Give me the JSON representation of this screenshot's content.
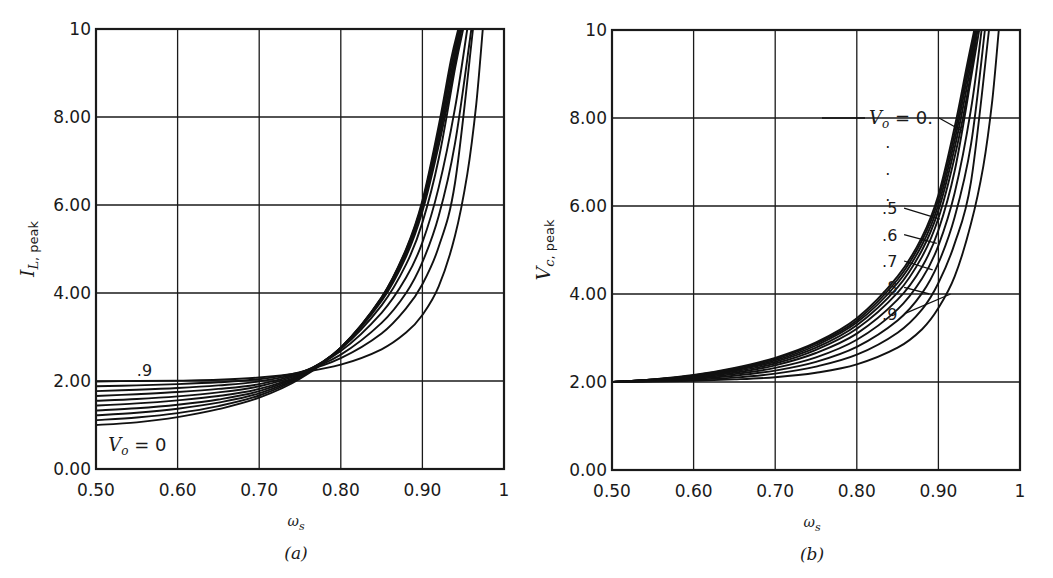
{
  "chart_data": [
    {
      "id": "a",
      "type": "line",
      "title": "",
      "caption": "(a)",
      "xlabel": "ω_s",
      "ylabel": "I_L, peak",
      "ylabel_main": "I",
      "ylabel_sub": "L, peak",
      "xlabel_main": "ω",
      "xlabel_sub": "s",
      "xlim": [
        0.5,
        1.0
      ],
      "ylim": [
        0,
        10
      ],
      "grid": true,
      "xticks": [
        "0.50",
        "0.60",
        "0.70",
        "0.80",
        "0.90",
        "1"
      ],
      "yticks": [
        "0.00",
        "2.00",
        "4.00",
        "6.00",
        "8.00",
        "10"
      ],
      "annotations": [
        {
          "text": ".9",
          "x": 0.55,
          "y": 2.25
        },
        {
          "text": "V_o = 0",
          "x": 0.515,
          "y": 0.55
        }
      ],
      "series": [
        {
          "name": "V_o = 0",
          "x": [
            0.5,
            0.55,
            0.6,
            0.65,
            0.7,
            0.75,
            0.8,
            0.85,
            0.88,
            0.9,
            0.92,
            0.935,
            0.944
          ],
          "values": [
            1.0,
            1.06,
            1.18,
            1.36,
            1.62,
            2.05,
            2.75,
            3.9,
            5.0,
            6.1,
            7.8,
            9.3,
            10.0
          ]
        },
        {
          "name": "V_o = 0.1",
          "x": [
            0.5,
            0.55,
            0.6,
            0.65,
            0.7,
            0.75,
            0.8,
            0.85,
            0.88,
            0.9,
            0.92,
            0.935,
            0.945
          ],
          "values": [
            1.11,
            1.17,
            1.27,
            1.43,
            1.67,
            2.08,
            2.76,
            3.9,
            4.98,
            6.05,
            7.7,
            9.15,
            10.0
          ]
        },
        {
          "name": "V_o = 0.2",
          "x": [
            0.5,
            0.55,
            0.6,
            0.65,
            0.7,
            0.75,
            0.8,
            0.85,
            0.88,
            0.9,
            0.92,
            0.935,
            0.946
          ],
          "values": [
            1.22,
            1.28,
            1.37,
            1.51,
            1.72,
            2.1,
            2.76,
            3.88,
            4.95,
            6.0,
            7.6,
            9.0,
            10.0
          ]
        },
        {
          "name": "V_o = 0.3",
          "x": [
            0.5,
            0.55,
            0.6,
            0.65,
            0.7,
            0.75,
            0.8,
            0.85,
            0.88,
            0.9,
            0.92,
            0.935,
            0.947
          ],
          "values": [
            1.33,
            1.38,
            1.46,
            1.58,
            1.77,
            2.12,
            2.76,
            3.86,
            4.9,
            5.93,
            7.48,
            8.85,
            10.0
          ]
        },
        {
          "name": "V_o = 0.4",
          "x": [
            0.5,
            0.55,
            0.6,
            0.65,
            0.7,
            0.75,
            0.8,
            0.85,
            0.88,
            0.9,
            0.92,
            0.935,
            0.948
          ],
          "values": [
            1.44,
            1.49,
            1.56,
            1.66,
            1.82,
            2.14,
            2.75,
            3.82,
            4.83,
            5.85,
            7.35,
            8.7,
            10.0
          ]
        },
        {
          "name": "V_o = 0.5",
          "x": [
            0.5,
            0.55,
            0.6,
            0.65,
            0.7,
            0.75,
            0.8,
            0.85,
            0.88,
            0.9,
            0.92,
            0.94,
            0.95
          ],
          "values": [
            1.55,
            1.59,
            1.65,
            1.74,
            1.88,
            2.16,
            2.73,
            3.72,
            4.65,
            5.6,
            7.05,
            9.1,
            10.0
          ]
        },
        {
          "name": "V_o = 0.6",
          "x": [
            0.5,
            0.55,
            0.6,
            0.65,
            0.7,
            0.75,
            0.8,
            0.85,
            0.88,
            0.9,
            0.92,
            0.94,
            0.955
          ],
          "values": [
            1.66,
            1.7,
            1.75,
            1.82,
            1.93,
            2.18,
            2.68,
            3.55,
            4.35,
            5.15,
            6.4,
            8.2,
            10.0
          ]
        },
        {
          "name": "V_o = 0.7",
          "x": [
            0.5,
            0.55,
            0.6,
            0.65,
            0.7,
            0.75,
            0.8,
            0.85,
            0.88,
            0.9,
            0.92,
            0.94,
            0.96
          ],
          "values": [
            1.77,
            1.8,
            1.84,
            1.9,
            1.99,
            2.19,
            2.6,
            3.32,
            4.0,
            4.7,
            5.75,
            7.4,
            10.0
          ]
        },
        {
          "name": "V_o = 0.8",
          "x": [
            0.5,
            0.55,
            0.6,
            0.65,
            0.7,
            0.75,
            0.8,
            0.85,
            0.88,
            0.9,
            0.92,
            0.94,
            0.962
          ],
          "values": [
            1.88,
            1.9,
            1.93,
            1.97,
            2.04,
            2.2,
            2.52,
            3.08,
            3.65,
            4.2,
            5.05,
            6.5,
            10.0
          ]
        },
        {
          "name": "V_o = 0.9",
          "x": [
            0.5,
            0.55,
            0.6,
            0.65,
            0.7,
            0.75,
            0.8,
            0.85,
            0.88,
            0.9,
            0.92,
            0.94,
            0.955,
            0.966,
            0.974
          ],
          "values": [
            1.99,
            2.0,
            2.01,
            2.03,
            2.08,
            2.19,
            2.37,
            2.72,
            3.1,
            3.5,
            4.15,
            5.3,
            6.7,
            8.3,
            10.0
          ]
        }
      ]
    },
    {
      "id": "b",
      "type": "line",
      "title": "",
      "caption": "(b)",
      "xlabel": "ω_s",
      "ylabel": "V_c, peak",
      "ylabel_main": "V",
      "ylabel_sub": "c, peak",
      "xlabel_main": "ω",
      "xlabel_sub": "s",
      "xlim": [
        0.5,
        1.0
      ],
      "ylim": [
        0,
        10
      ],
      "grid": true,
      "xticks": [
        "0.50",
        "0.60",
        "0.70",
        "0.80",
        "0.90",
        "1"
      ],
      "yticks": [
        "0.00",
        "2.00",
        "4.00",
        "6.00",
        "8.00",
        "10"
      ],
      "annotations": [
        {
          "text": "V_o = 0.",
          "x": 0.815,
          "y": 8.0,
          "target_x": 0.93,
          "target_y": 7.7
        },
        {
          "text": ".",
          "x": 0.835,
          "y": 7.45
        },
        {
          "text": ".",
          "x": 0.835,
          "y": 6.85
        },
        {
          "text": ".",
          "x": 0.835,
          "y": 6.25
        },
        {
          "text": ".5",
          "x": 0.831,
          "y": 5.95,
          "target_x": 0.902,
          "target_y": 5.7
        },
        {
          "text": ".6",
          "x": 0.831,
          "y": 5.35,
          "target_x": 0.898,
          "target_y": 5.15
        },
        {
          "text": ".7",
          "x": 0.831,
          "y": 4.75,
          "target_x": 0.893,
          "target_y": 4.55
        },
        {
          "text": ".8",
          "x": 0.831,
          "y": 4.15,
          "target_x": 0.889,
          "target_y": 4.0
        },
        {
          "text": ".9",
          "x": 0.831,
          "y": 3.55,
          "target_x": 0.915,
          "target_y": 4.0
        }
      ],
      "series": [
        {
          "name": "V_o = 0",
          "x": [
            0.5,
            0.55,
            0.6,
            0.65,
            0.7,
            0.75,
            0.8,
            0.85,
            0.88,
            0.9,
            0.92,
            0.935,
            0.944
          ],
          "values": [
            2.0,
            2.06,
            2.16,
            2.32,
            2.55,
            2.9,
            3.45,
            4.4,
            5.3,
            6.25,
            7.8,
            9.2,
            10.0
          ]
        },
        {
          "name": "V_o = 0.1",
          "x": [
            0.5,
            0.55,
            0.6,
            0.65,
            0.7,
            0.75,
            0.8,
            0.85,
            0.88,
            0.9,
            0.92,
            0.935,
            0.945
          ],
          "values": [
            2.0,
            2.06,
            2.15,
            2.3,
            2.52,
            2.87,
            3.4,
            4.33,
            5.22,
            6.15,
            7.65,
            9.05,
            10.0
          ]
        },
        {
          "name": "V_o = 0.2",
          "x": [
            0.5,
            0.55,
            0.6,
            0.65,
            0.7,
            0.75,
            0.8,
            0.85,
            0.88,
            0.9,
            0.92,
            0.935,
            0.946
          ],
          "values": [
            2.0,
            2.05,
            2.14,
            2.28,
            2.49,
            2.83,
            3.35,
            4.25,
            5.12,
            6.03,
            7.5,
            8.9,
            10.0
          ]
        },
        {
          "name": "V_o = 0.3",
          "x": [
            0.5,
            0.55,
            0.6,
            0.65,
            0.7,
            0.75,
            0.8,
            0.85,
            0.88,
            0.9,
            0.92,
            0.935,
            0.947
          ],
          "values": [
            2.0,
            2.05,
            2.13,
            2.26,
            2.46,
            2.78,
            3.29,
            4.15,
            5.0,
            5.9,
            7.33,
            8.72,
            10.0
          ]
        },
        {
          "name": "V_o = 0.4",
          "x": [
            0.5,
            0.55,
            0.6,
            0.65,
            0.7,
            0.75,
            0.8,
            0.85,
            0.88,
            0.9,
            0.92,
            0.935,
            0.948
          ],
          "values": [
            2.0,
            2.05,
            2.12,
            2.24,
            2.42,
            2.73,
            3.21,
            4.03,
            4.85,
            5.72,
            7.12,
            8.5,
            10.0
          ]
        },
        {
          "name": "V_o = 0.5",
          "x": [
            0.5,
            0.55,
            0.6,
            0.65,
            0.7,
            0.75,
            0.8,
            0.85,
            0.88,
            0.9,
            0.92,
            0.94,
            0.95
          ],
          "values": [
            2.0,
            2.04,
            2.11,
            2.21,
            2.38,
            2.66,
            3.1,
            3.87,
            4.62,
            5.45,
            6.8,
            8.9,
            10.0
          ]
        },
        {
          "name": "V_o = 0.6",
          "x": [
            0.5,
            0.55,
            0.6,
            0.65,
            0.7,
            0.75,
            0.8,
            0.85,
            0.88,
            0.9,
            0.92,
            0.94,
            0.953
          ],
          "values": [
            2.0,
            2.04,
            2.09,
            2.18,
            2.32,
            2.56,
            2.96,
            3.65,
            4.35,
            5.1,
            6.3,
            8.2,
            10.0
          ]
        },
        {
          "name": "V_o = 0.7",
          "x": [
            0.5,
            0.55,
            0.6,
            0.65,
            0.7,
            0.75,
            0.8,
            0.85,
            0.88,
            0.9,
            0.92,
            0.94,
            0.957
          ],
          "values": [
            2.0,
            2.03,
            2.07,
            2.14,
            2.26,
            2.46,
            2.8,
            3.4,
            4.02,
            4.7,
            5.75,
            7.4,
            10.0
          ]
        },
        {
          "name": "V_o = 0.8",
          "x": [
            0.5,
            0.55,
            0.6,
            0.65,
            0.7,
            0.75,
            0.8,
            0.85,
            0.88,
            0.9,
            0.92,
            0.94,
            0.962
          ],
          "values": [
            2.0,
            2.02,
            2.05,
            2.1,
            2.19,
            2.35,
            2.62,
            3.12,
            3.65,
            4.25,
            5.15,
            6.55,
            10.0
          ]
        },
        {
          "name": "V_o = 0.9",
          "x": [
            0.5,
            0.55,
            0.6,
            0.65,
            0.7,
            0.75,
            0.8,
            0.85,
            0.88,
            0.9,
            0.92,
            0.94,
            0.955,
            0.966,
            0.974
          ],
          "values": [
            2.0,
            2.01,
            2.03,
            2.06,
            2.11,
            2.21,
            2.4,
            2.78,
            3.2,
            3.68,
            4.4,
            5.6,
            6.9,
            8.4,
            10.0
          ]
        }
      ]
    }
  ]
}
